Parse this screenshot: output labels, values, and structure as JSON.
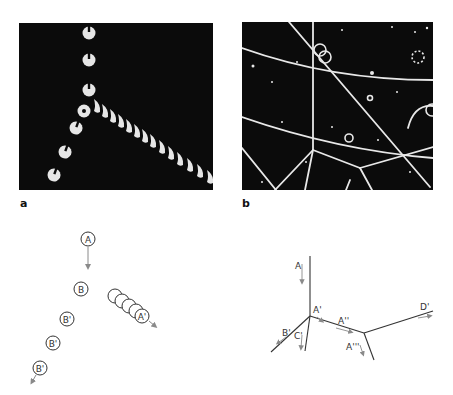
{
  "figure": {
    "panels": [
      {
        "id": "a",
        "label": "a",
        "type": "photograph",
        "description": "bubble chamber track photo: incoming track splits into two branches"
      },
      {
        "id": "b",
        "label": "b",
        "type": "photograph",
        "description": "bubble chamber photo with multiple tracks and vertices"
      }
    ],
    "diagram_a": {
      "particles": [
        "A",
        "B",
        "B'",
        "B'",
        "B'",
        "A'"
      ],
      "labels": {
        "a": "A",
        "b": "B",
        "b1": "B'",
        "b2": "B'",
        "b3": "B'",
        "a1": "A'"
      }
    },
    "diagram_b": {
      "labels": {
        "a": "A",
        "a1": "A'",
        "a2": "A''",
        "a3": "A'''",
        "b1": "B'",
        "c1": "C'",
        "d1": "D'"
      }
    },
    "colors": {
      "photo_bg": "#0b0b0b",
      "track": "#e8e8e8",
      "line": "#333333",
      "arrow": "#8a8a8a"
    }
  }
}
